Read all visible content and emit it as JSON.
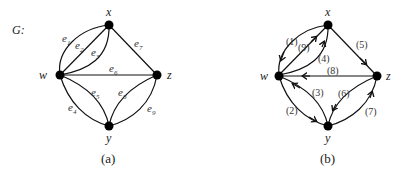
{
  "graph_a": {
    "title": "G:",
    "caption": "(a)",
    "nodes": {
      "x": "x",
      "w": "w",
      "z": "z",
      "y": "y"
    },
    "edges": [
      {
        "id": "e1",
        "base": "e",
        "sub": "1",
        "from": "w",
        "to": "x"
      },
      {
        "id": "e2",
        "base": "e",
        "sub": "2",
        "from": "w",
        "to": "x"
      },
      {
        "id": "e3",
        "base": "e",
        "sub": "3",
        "from": "w",
        "to": "x"
      },
      {
        "id": "e4",
        "base": "e",
        "sub": "4",
        "from": "w",
        "to": "y"
      },
      {
        "id": "e5",
        "base": "e",
        "sub": "5",
        "from": "w",
        "to": "y"
      },
      {
        "id": "e6",
        "base": "e",
        "sub": "6",
        "from": "w",
        "to": "z"
      },
      {
        "id": "e7",
        "base": "e",
        "sub": "7",
        "from": "x",
        "to": "z"
      },
      {
        "id": "e8",
        "base": "e",
        "sub": "8",
        "from": "y",
        "to": "z"
      },
      {
        "id": "e9",
        "base": "e",
        "sub": "9",
        "from": "y",
        "to": "z"
      }
    ]
  },
  "graph_b": {
    "caption": "(b)",
    "nodes": {
      "x": "x",
      "w": "w",
      "z": "z",
      "y": "y"
    },
    "edges": [
      {
        "label": "(1)",
        "from": "x",
        "to": "w"
      },
      {
        "label": "(2)",
        "from": "w",
        "to": "y"
      },
      {
        "label": "(3)",
        "from": "y",
        "to": "w"
      },
      {
        "label": "(4)",
        "from": "w",
        "to": "x"
      },
      {
        "label": "(5)",
        "from": "x",
        "to": "z"
      },
      {
        "label": "(6)",
        "from": "z",
        "to": "y"
      },
      {
        "label": "(7)",
        "from": "y",
        "to": "z"
      },
      {
        "label": "(8)",
        "from": "z",
        "to": "w"
      },
      {
        "label": "(9)",
        "from": "w",
        "to": "x"
      }
    ]
  }
}
